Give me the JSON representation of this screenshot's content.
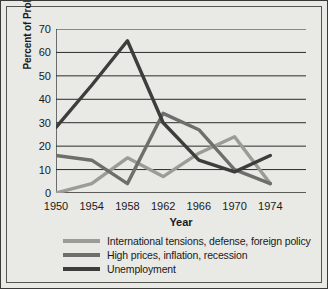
{
  "chart_data": {
    "type": "line",
    "title": "",
    "xlabel": "Year",
    "ylabel": "Percent of Problems Mentioned",
    "x": [
      1950,
      1954,
      1958,
      1962,
      1966,
      1970,
      1974
    ],
    "xticks": [
      "1950",
      "1954",
      "1958",
      "1962",
      "1966",
      "1970",
      "1974"
    ],
    "yticks": [
      "0",
      "10",
      "20",
      "30",
      "40",
      "50",
      "60",
      "70"
    ],
    "xlim": [
      1950,
      1978
    ],
    "ylim": [
      0,
      70
    ],
    "grid": "horizontal",
    "legend_position": "below",
    "series": [
      {
        "name": "International tensions, defense, foreign policy",
        "color": "#9b9b97",
        "values": [
          0,
          4,
          15,
          7,
          17,
          24,
          4
        ]
      },
      {
        "name": "High prices, inflation, recession",
        "color": "#6e6e6a",
        "values": [
          16,
          14,
          4,
          34,
          27,
          10,
          4
        ]
      },
      {
        "name": "Unemployment",
        "color": "#3d3d3b",
        "values": [
          28,
          46,
          65,
          30,
          14,
          9,
          16
        ]
      }
    ]
  },
  "legend": {
    "items": [
      "International tensions, defense, foreign policy",
      "High prices, inflation, recession",
      "Unemployment"
    ]
  }
}
